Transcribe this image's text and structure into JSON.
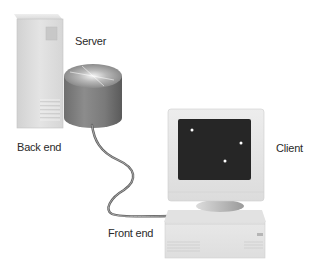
{
  "diagram": {
    "type": "client-server architecture",
    "labels": {
      "server": "Server",
      "back_end": "Back end",
      "client": "Client",
      "front_end": "Front end"
    },
    "nodes": [
      {
        "id": "server",
        "icon": "server-tower-icon",
        "label": "Server"
      },
      {
        "id": "storage",
        "icon": "disk-cylinder-icon",
        "label": ""
      },
      {
        "id": "client",
        "icon": "desktop-computer-icon",
        "label": "Client"
      }
    ],
    "groups": [
      {
        "id": "back_end",
        "label": "Back end",
        "members": [
          "server",
          "storage"
        ]
      },
      {
        "id": "front_end",
        "label": "Front end",
        "members": [
          "client"
        ]
      }
    ],
    "edges": [
      {
        "from": "storage",
        "to": "client",
        "style": "cable"
      }
    ],
    "colors": {
      "background": "#ffffff",
      "device_light": "#e6e6e6",
      "device_mid": "#cfcfcf",
      "screen": "#262626",
      "cable": "#6a6a6a",
      "text": "#2a2a2a"
    }
  }
}
